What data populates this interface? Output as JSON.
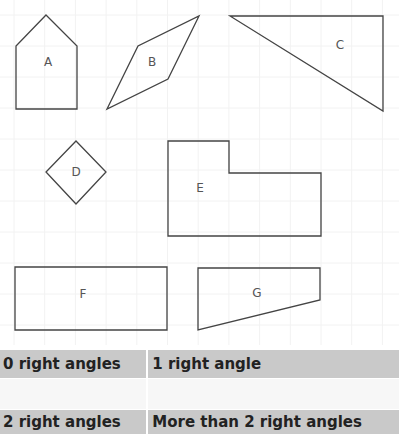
{
  "shapes": [
    {
      "id": "A",
      "label": "A",
      "points": "46,15 77,46 77,109 16,109 16,46",
      "label_pos": [
        48,
        62
      ]
    },
    {
      "id": "B",
      "label": "B",
      "points": "107,109 138,46 199,16 168,79",
      "label_pos": [
        152,
        62
      ]
    },
    {
      "id": "C",
      "label": "C",
      "points": "230,16 383,16 383,111",
      "label_pos": [
        340,
        45
      ]
    },
    {
      "id": "D",
      "label": "D",
      "points": "76,141 106,172 76,204 46,172",
      "label_pos": [
        76,
        172
      ]
    },
    {
      "id": "E",
      "label": "E",
      "points": "168,141 229,141 229,173 321,173 321,236 168,236",
      "label_pos": [
        200,
        188
      ]
    },
    {
      "id": "F",
      "label": "F",
      "points": "15,267 167,267 167,330 15,330",
      "label_pos": [
        83,
        294
      ]
    },
    {
      "id": "G",
      "label": "G",
      "points": "198,268 320,268 320,300 198,330",
      "label_pos": [
        257,
        293
      ]
    }
  ],
  "table": {
    "header_row_1": [
      "0 right angles",
      "1 right angle"
    ],
    "answer_row_1": [
      "",
      ""
    ],
    "header_row_2": [
      "2 right angles",
      "More than 2 right angles"
    ]
  },
  "colors": {
    "header_bg": "#c9c9c9",
    "stroke": "#444444"
  }
}
